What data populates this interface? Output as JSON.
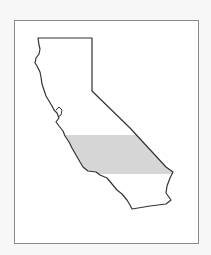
{
  "map": {
    "subject": "California state outline",
    "highlighted_region": "Central California band",
    "colors": {
      "background": "#f7f7f7",
      "frame_fill": "#ffffff",
      "frame_border": "#8a8a8a",
      "outline": "#333333",
      "highlight_fill": "#d6d6d6"
    }
  }
}
